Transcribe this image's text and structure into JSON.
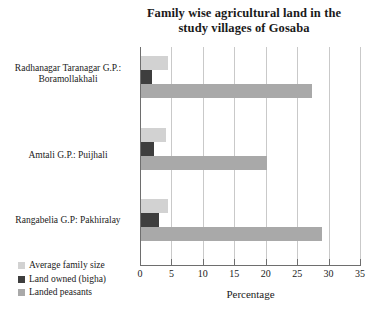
{
  "chart_data": {
    "type": "bar",
    "orientation": "horizontal",
    "title": "Family wise agricultural land in the study villages of Gosaba",
    "title_line1": "Family wise agricultural land in the",
    "title_line2": "study villages of Gosaba",
    "xlabel": "Percentage",
    "ylabel": "",
    "xlim": [
      0,
      35
    ],
    "xticks": [
      0,
      5,
      10,
      15,
      20,
      25,
      30,
      35
    ],
    "xtick_labels": [
      "0",
      "5",
      "10",
      "15",
      "20",
      "25",
      "30",
      "35"
    ],
    "grid": "vertical",
    "legend_position": "bottom-left",
    "categories": [
      "Radhanagar Taranagar G.P.: Boramollakhali",
      "Amtali G.P.: Puijhali",
      "Rangabelia G.P: Pakhiralay"
    ],
    "category_lines": [
      [
        "Radhanagar Taranagar G.P.:",
        "Boramollakhali"
      ],
      [
        "Amtali G.P.: Puijhali"
      ],
      [
        "Rangabelia G.P: Pakhiralay"
      ]
    ],
    "series": [
      {
        "name": "Average family size",
        "color": "#d2d2d2",
        "values": [
          4.5,
          4.1,
          4.5
        ]
      },
      {
        "name": "Land owned (bigha)",
        "color": "#3e3e3e",
        "values": [
          1.9,
          2.2,
          3.0
        ]
      },
      {
        "name": "Landed peasants",
        "color": "#a9a9a9",
        "values": [
          27.4,
          20.2,
          29.0
        ]
      }
    ]
  }
}
